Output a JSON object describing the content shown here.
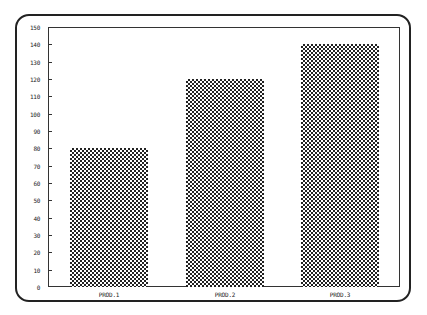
{
  "chart_data": {
    "type": "bar",
    "title": "",
    "xlabel": "",
    "ylabel": "",
    "categories": [
      "PROD.1",
      "PROD.2",
      "PROD.3"
    ],
    "values": [
      80,
      120,
      140
    ],
    "ylim": [
      0,
      150
    ],
    "yticks": [
      0,
      10,
      20,
      30,
      40,
      50,
      60,
      70,
      80,
      90,
      100,
      110,
      120,
      130,
      140,
      150
    ],
    "grid": false,
    "legend": null,
    "bar_fill": "crosshatch pattern (black/white)"
  },
  "colors": {
    "frame": "#222222",
    "bar_pattern": "#222222",
    "background": "#ffffff"
  }
}
